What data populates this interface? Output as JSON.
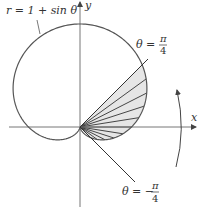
{
  "figure": {
    "curve_label": "r = 1 + sin θ",
    "x_axis_label": "x",
    "y_axis_label": "y",
    "upper_ray": {
      "theta_prefix": "θ =",
      "numerator": "π",
      "denominator": "4"
    },
    "lower_ray": {
      "theta_prefix": "θ = −",
      "numerator": "π",
      "denominator": "4"
    },
    "colors": {
      "stroke": "#555555",
      "fill": "#e6e6e6",
      "axis": "#777777"
    }
  }
}
